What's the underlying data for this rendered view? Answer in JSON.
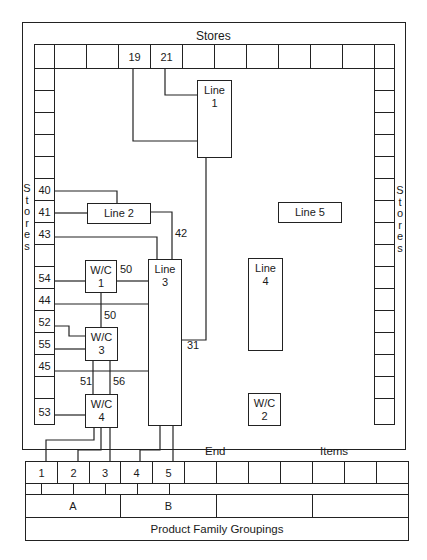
{
  "stores": {
    "top_label": "Stores",
    "left_label": "Stores",
    "right_label": "Stores"
  },
  "top_row": {
    "cells": [
      "",
      "",
      "",
      "19",
      "21",
      "",
      "",
      "",
      "",
      "",
      "",
      ""
    ]
  },
  "left_column": {
    "cells": [
      "",
      "",
      "",
      "",
      "",
      "40",
      "41",
      "43",
      "",
      "54",
      "44",
      "52",
      "55",
      "45",
      "",
      "53"
    ]
  },
  "right_column": {
    "cells": [
      "",
      "",
      "",
      "",
      "",
      "",
      "",
      "",
      "",
      "",
      "",
      "",
      "",
      "",
      "",
      ""
    ]
  },
  "work_centers": {
    "line1": "Line\n1",
    "line1_a": "Line",
    "line1_b": "1",
    "line2": "Line 2",
    "line3_a": "Line",
    "line3_b": "3",
    "line4_a": "Line",
    "line4_b": "4",
    "line5": "Line 5",
    "wc1_a": "W/C",
    "wc1_b": "1",
    "wc2_a": "W/C",
    "wc2_b": "2",
    "wc3_a": "W/C",
    "wc3_b": "3",
    "wc4_a": "W/C",
    "wc4_b": "4"
  },
  "flow_labels": {
    "f42": "42",
    "f50_right": "50",
    "f50_down": "50",
    "f31": "31",
    "f51": "51",
    "f56": "56"
  },
  "end_items": {
    "label_end": "End",
    "label_items": "Items",
    "cells": [
      "1",
      "2",
      "3",
      "4",
      "5",
      "",
      "",
      "",
      "",
      "",
      "",
      ""
    ]
  },
  "families": {
    "groups": [
      "A",
      "B",
      "",
      ""
    ],
    "footer": "Product Family Groupings"
  }
}
